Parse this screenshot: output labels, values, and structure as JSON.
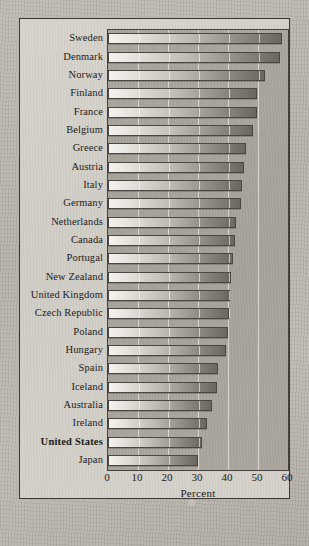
{
  "chart_data": {
    "type": "bar",
    "orientation": "horizontal",
    "title": "",
    "xlabel": "Percent",
    "ylabel": "",
    "xlim": [
      0,
      60
    ],
    "xticks": [
      0,
      10,
      20,
      30,
      40,
      50,
      60
    ],
    "grid": true,
    "legend": null,
    "highlight_category": "United States",
    "categories": [
      "Sweden",
      "Denmark",
      "Norway",
      "Finland",
      "France",
      "Belgium",
      "Greece",
      "Austria",
      "Italy",
      "Germany",
      "Netherlands",
      "Canada",
      "Portugal",
      "New Zealand",
      "United Kingdom",
      "Czech Republic",
      "Poland",
      "Hungary",
      "Spain",
      "Iceland",
      "Australia",
      "Ireland",
      "United States",
      "Japan"
    ],
    "values": [
      58.0,
      57.3,
      52.2,
      49.8,
      49.6,
      48.4,
      46.0,
      45.2,
      44.6,
      44.2,
      42.6,
      42.4,
      41.8,
      41.0,
      40.6,
      40.4,
      40.0,
      39.4,
      36.6,
      36.4,
      34.6,
      33.0,
      31.2,
      30.0
    ]
  },
  "axis": {
    "x_title": "Percent"
  }
}
